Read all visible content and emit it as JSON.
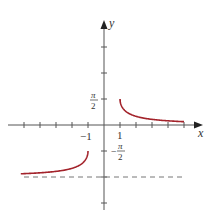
{
  "chart_data": {
    "type": "line",
    "title": "",
    "xlabel": "x",
    "ylabel": "y",
    "function": "arccsc(x) with range [-π, -π/2) ∪ (0, π/2]",
    "xlim": [
      -5.5,
      6.2
    ],
    "ylim": [
      -3.3,
      4.1
    ],
    "grid": false,
    "legend": null,
    "x_tick_labels": [
      {
        "value": -1,
        "label": "−1"
      },
      {
        "value": 1,
        "label": "1"
      }
    ],
    "y_tick_labels": [
      {
        "value": 1.5708,
        "label_num": "π",
        "label_den": "2",
        "sign": ""
      },
      {
        "value": -1.5708,
        "label_num": "π",
        "label_den": "2",
        "sign": "−"
      }
    ],
    "asymptote": {
      "y": -3.1416,
      "style": "dashed",
      "color": "#777777"
    },
    "series": [
      {
        "name": "right-branch",
        "color": "#a3232b",
        "x": [
          1,
          1.05,
          1.15,
          1.3,
          1.5,
          1.8,
          2.2,
          2.7,
          3.2,
          3.8,
          4.4,
          5
        ],
        "y": [
          1.5708,
          1.2532,
          1.0552,
          0.8776,
          0.7297,
          0.589,
          0.4719,
          0.3801,
          0.3178,
          0.266,
          0.2301,
          0.2014
        ]
      },
      {
        "name": "left-branch",
        "color": "#a3232b",
        "x": [
          -5.2,
          -4.6,
          -4,
          -3.4,
          -2.8,
          -2.3,
          -1.9,
          -1.6,
          -1.35,
          -1.2,
          -1.08,
          -1
        ],
        "y": [
          -2.948,
          -2.9224,
          -2.8889,
          -2.843,
          -2.7764,
          -2.7037,
          -2.5918,
          -2.4666,
          -2.288,
          -2.1272,
          -1.9603,
          -1.5708
        ]
      }
    ]
  },
  "labels": {
    "x_axis": "x",
    "y_axis": "y",
    "tick_neg1": "−1",
    "tick_1": "1",
    "pi": "π",
    "two": "2",
    "minus": "−"
  }
}
